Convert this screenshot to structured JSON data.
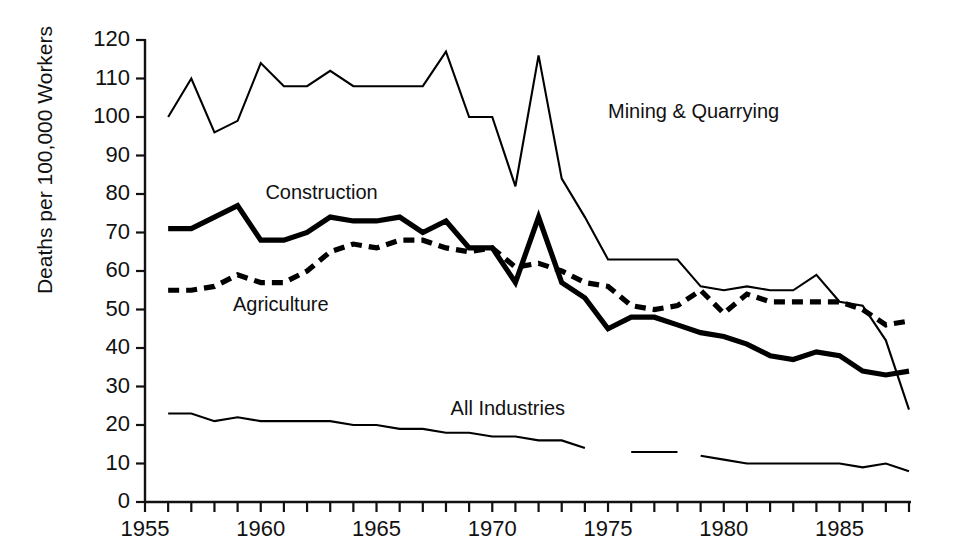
{
  "chart_data": {
    "type": "line",
    "title": "",
    "xlabel": "",
    "ylabel": "Deaths per 100,000 Workers",
    "xlim": [
      1955,
      1988
    ],
    "ylim": [
      0,
      120
    ],
    "grid": false,
    "legend_position": "inline-annotations",
    "y_ticks": [
      0,
      10,
      20,
      30,
      40,
      50,
      60,
      70,
      80,
      90,
      100,
      110,
      120
    ],
    "y_tick_labels": [
      "0",
      "10",
      "20",
      "30",
      "40",
      "50",
      "60",
      "70",
      "80",
      "90",
      "100",
      "110",
      "120"
    ],
    "x_ticks": [
      1955,
      1956,
      1957,
      1958,
      1959,
      1960,
      1961,
      1962,
      1963,
      1964,
      1965,
      1966,
      1967,
      1968,
      1969,
      1970,
      1971,
      1972,
      1973,
      1974,
      1975,
      1976,
      1977,
      1978,
      1979,
      1980,
      1981,
      1982,
      1983,
      1984,
      1985,
      1986,
      1987,
      1988
    ],
    "x_tick_labels": [
      "1955",
      "1960",
      "1965",
      "1970",
      "1975",
      "1980",
      "1985"
    ],
    "x_labeled_ticks": [
      1955,
      1960,
      1965,
      1970,
      1975,
      1980,
      1985
    ],
    "series": [
      {
        "name": "Mining & Quarrying",
        "style": "thin-solid",
        "color": "#000000",
        "x": [
          1956,
          1957,
          1958,
          1959,
          1960,
          1961,
          1962,
          1963,
          1964,
          1965,
          1966,
          1967,
          1968,
          1969,
          1970,
          1971,
          1972,
          1973,
          1974,
          1975,
          1976,
          1977,
          1978,
          1979,
          1980,
          1981,
          1982,
          1983,
          1984,
          1985,
          1986,
          1987,
          1988
        ],
        "values": [
          100,
          110,
          96,
          99,
          114,
          108,
          108,
          112,
          108,
          108,
          108,
          108,
          117,
          100,
          100,
          82,
          116,
          84,
          74,
          63,
          63,
          63,
          63,
          56,
          55,
          56,
          55,
          55,
          59,
          52,
          51,
          42,
          24
        ]
      },
      {
        "name": "Construction",
        "style": "thick-solid",
        "color": "#000000",
        "x": [
          1956,
          1957,
          1958,
          1959,
          1960,
          1961,
          1962,
          1963,
          1964,
          1965,
          1966,
          1967,
          1968,
          1969,
          1970,
          1971,
          1972,
          1973,
          1974,
          1975,
          1976,
          1977,
          1978,
          1979,
          1980,
          1981,
          1982,
          1983,
          1984,
          1985,
          1986,
          1987,
          1988
        ],
        "values": [
          71,
          71,
          74,
          77,
          68,
          68,
          70,
          74,
          73,
          73,
          74,
          70,
          73,
          66,
          66,
          57,
          74,
          57,
          53,
          45,
          48,
          48,
          46,
          44,
          43,
          41,
          38,
          37,
          39,
          38,
          34,
          33,
          34
        ]
      },
      {
        "name": "Agriculture",
        "style": "dashed",
        "color": "#000000",
        "x": [
          1956,
          1957,
          1958,
          1959,
          1960,
          1961,
          1962,
          1963,
          1964,
          1965,
          1966,
          1967,
          1968,
          1969,
          1970,
          1971,
          1972,
          1973,
          1974,
          1975,
          1976,
          1977,
          1978,
          1979,
          1980,
          1981,
          1982,
          1983,
          1984,
          1985,
          1986,
          1987,
          1988
        ],
        "values": [
          55,
          55,
          56,
          59,
          57,
          57,
          60,
          65,
          67,
          66,
          68,
          68,
          66,
          65,
          66,
          61,
          62,
          60,
          57,
          56,
          51,
          50,
          51,
          55,
          49,
          54,
          52,
          52,
          52,
          52,
          50,
          46,
          47
        ]
      },
      {
        "name": "All Industries",
        "style": "thin-solid",
        "color": "#000000",
        "segments": [
          {
            "x": [
              1956,
              1957,
              1958,
              1959,
              1960,
              1961,
              1962,
              1963,
              1964,
              1965,
              1966,
              1967,
              1968,
              1969,
              1970,
              1971,
              1972,
              1973,
              1974
            ],
            "values": [
              23,
              23,
              21,
              22,
              21,
              21,
              21,
              21,
              20,
              20,
              19,
              19,
              18,
              18,
              17,
              17,
              16,
              16,
              14
            ]
          },
          {
            "x": [
              1976,
              1977,
              1978
            ],
            "values": [
              13,
              13,
              13
            ]
          },
          {
            "x": [
              1979,
              1980,
              1981,
              1982,
              1983,
              1984,
              1985,
              1986,
              1987,
              1988
            ],
            "values": [
              12,
              11,
              10,
              10,
              10,
              10,
              10,
              9,
              10,
              8
            ]
          }
        ]
      }
    ],
    "annotations": [
      {
        "text": "Mining & Quarrying",
        "x": 1975,
        "y": 101
      },
      {
        "text": "Construction",
        "x": 1960.2,
        "y": 80
      },
      {
        "text": "Agriculture",
        "x": 1958.8,
        "y": 51
      },
      {
        "text": "All Industries",
        "x": 1968.2,
        "y": 24
      }
    ]
  }
}
